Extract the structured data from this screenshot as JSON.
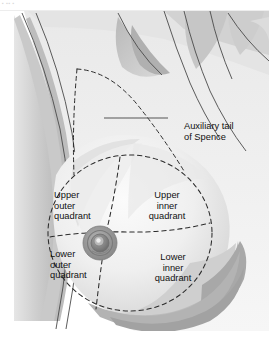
{
  "page": {
    "background_color": "#ffffff",
    "top_strip_fragment": "▪ ▪▪ ▪"
  },
  "figure": {
    "style": "grayscale medical line drawing",
    "colors": {
      "skin_light": "#f2f2f2",
      "skin_mid": "#dcdcdc",
      "skin_shadow": "#c3c3c3",
      "skin_deep_shadow": "#a9a9a9",
      "outline": "#3c3c3c",
      "dashed_line": "#2b2b2b",
      "areola": "#8f8f8f",
      "nipple": "#6f6f6f",
      "label_text": "#111111",
      "leader_line": "#555555"
    },
    "callout": {
      "label_line1": "Auxiliary tail",
      "label_line2": "of Spence",
      "leader_line": {
        "x1": 90,
        "y1": 107,
        "x2": 154,
        "y2": 107
      }
    },
    "quadrants": [
      {
        "id": "upper-outer",
        "line1": "Upper",
        "line2": "outer",
        "line3": "quadrant"
      },
      {
        "id": "upper-inner",
        "line1": "Upper",
        "line2": "inner",
        "line3": "quadrant"
      },
      {
        "id": "lower-outer",
        "line1": "Lower",
        "line2": "outer",
        "line3": "quadrant"
      },
      {
        "id": "lower-inner",
        "line1": "Lower",
        "line2": "inner",
        "line3": "quadrant"
      }
    ],
    "nipple": {
      "label": "nipple-areola-complex",
      "center_x": 86,
      "center_y": 232,
      "areola_radius": 16,
      "nipple_radius": 5
    }
  }
}
